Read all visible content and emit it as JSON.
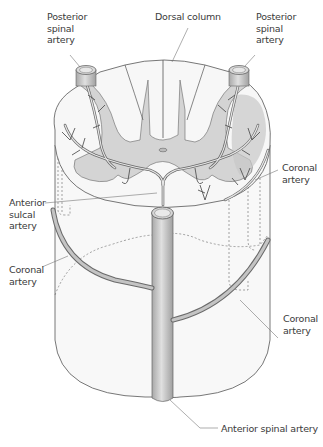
{
  "figure": {
    "colors": {
      "artery_fill": "#bdbdbd",
      "artery_stroke": "#6a6a6a",
      "gray_matter": "#d4d4d4",
      "white_matter": "#f7f7f7",
      "outline": "#555555",
      "leader_line": "#777777"
    },
    "labels": {
      "posterior_spinal_artery_left": "Posterior\nspinal\nartery",
      "dorsal_column": "Dorsal column",
      "posterior_spinal_artery_right": "Posterior\nspinal\nartery",
      "coronal_artery_upper_right": "Coronal\nartery",
      "anterior_sulcal_artery": "Anterior\nsulcal\nartery",
      "coronal_artery_left": "Coronal\nartery",
      "coronal_artery_lower_right": "Coronal\nartery",
      "anterior_spinal_artery": "Anterior spinal artery"
    }
  }
}
